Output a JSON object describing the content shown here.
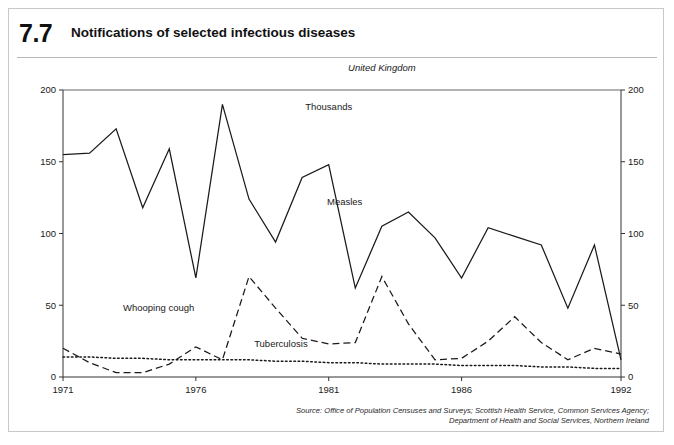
{
  "figure": {
    "number": "7.7",
    "title": "Notifications of selected infectious diseases",
    "region": "United Kingdom",
    "units": "Thousands",
    "source": {
      "line1": "Source: Office of Population Censuses and Surveys; Scottish Health Service, Common Services Agency;",
      "line2": "Department of Health and Social Services, Northern Ireland"
    }
  },
  "chart_data": {
    "type": "line",
    "title": "Notifications of selected infectious diseases",
    "subtitle": "United Kingdom",
    "xlabel": "",
    "ylabel": "Thousands",
    "ylim": [
      0,
      200
    ],
    "xlim": [
      1971,
      1992
    ],
    "yticks": [
      0,
      50,
      100,
      150,
      200
    ],
    "xticks": [
      1971,
      1976,
      1981,
      1986,
      1992
    ],
    "grid": false,
    "legend": "inline-annotations",
    "dual_axis": true,
    "x": [
      1971,
      1972,
      1973,
      1974,
      1975,
      1976,
      1977,
      1978,
      1979,
      1980,
      1981,
      1982,
      1983,
      1984,
      1985,
      1986,
      1987,
      1988,
      1989,
      1990,
      1991,
      1992
    ],
    "series": [
      {
        "name": "Measles",
        "style": "solid",
        "color": "#1a1a1a",
        "values": [
          155,
          156,
          173,
          118,
          159,
          69,
          190,
          124,
          94,
          139,
          148,
          62,
          105,
          115,
          97,
          69,
          104,
          98,
          92,
          48,
          92,
          12
        ]
      },
      {
        "name": "Whooping cough",
        "style": "dashed",
        "color": "#1a1a1a",
        "values": [
          20,
          10,
          3,
          3,
          9,
          21,
          12,
          70,
          48,
          27,
          23,
          24,
          70,
          37,
          12,
          13,
          25,
          42,
          24,
          12,
          20,
          16
        ]
      },
      {
        "name": "Tuberculosis",
        "style": "dotted",
        "color": "#1a1a1a",
        "values": [
          14,
          14,
          13,
          13,
          12,
          12,
          12,
          12,
          11,
          11,
          10,
          10,
          9,
          9,
          9,
          8,
          8,
          8,
          7,
          7,
          6,
          6
        ]
      }
    ],
    "annotations": [
      {
        "label": "Thousands",
        "x": 1981.0,
        "y": 186
      },
      {
        "label": "Measles",
        "x": 1981.6,
        "y": 120
      },
      {
        "label": "Whooping cough",
        "x": 1974.6,
        "y": 46
      },
      {
        "label": "Tuberculosis",
        "x": 1979.2,
        "y": 21
      },
      {
        "label": "United Kingdom",
        "x": 1983.0,
        "y": 213
      }
    ]
  },
  "axis": {
    "left_ticks": [
      "200",
      "150",
      "100",
      "50",
      "0"
    ],
    "right_ticks": [
      "200",
      "150",
      "100",
      "50",
      "0"
    ],
    "x_ticks": [
      "1971",
      "1976",
      "1981",
      "1986",
      "1992"
    ]
  }
}
